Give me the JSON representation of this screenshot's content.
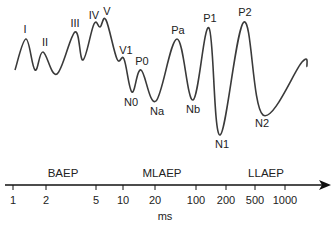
{
  "colors": {
    "waveform": "#3a3a3a",
    "axis": "#111111",
    "text": "#222222"
  },
  "waveform": {
    "points": [
      [
        15,
        70
      ],
      [
        26,
        39
      ],
      [
        35,
        70
      ],
      [
        43,
        52
      ],
      [
        57,
        74
      ],
      [
        75,
        32
      ],
      [
        83,
        60
      ],
      [
        94,
        24
      ],
      [
        100,
        27
      ],
      [
        106,
        20
      ],
      [
        117,
        59
      ],
      [
        124,
        59
      ],
      [
        132,
        92
      ],
      [
        141,
        70
      ],
      [
        156,
        101
      ],
      [
        177,
        39
      ],
      [
        193,
        100
      ],
      [
        209,
        28
      ],
      [
        220,
        135
      ],
      [
        244,
        22
      ],
      [
        263,
        115
      ],
      [
        302,
        62
      ],
      [
        307,
        67
      ]
    ]
  },
  "peaks": [
    {
      "label": "I",
      "x": 25,
      "y": 33
    },
    {
      "label": "II",
      "x": 45,
      "y": 46
    },
    {
      "label": "III",
      "x": 75,
      "y": 27
    },
    {
      "label": "IV",
      "x": 94,
      "y": 19
    },
    {
      "label": "V",
      "x": 107,
      "y": 15
    },
    {
      "label": "V1",
      "x": 126,
      "y": 54
    },
    {
      "label": "P0",
      "x": 142,
      "y": 65
    },
    {
      "label": "N0",
      "x": 131,
      "y": 106
    },
    {
      "label": "Na",
      "x": 157,
      "y": 115
    },
    {
      "label": "Pa",
      "x": 178,
      "y": 34
    },
    {
      "label": "Nb",
      "x": 193,
      "y": 113
    },
    {
      "label": "P1",
      "x": 210,
      "y": 22
    },
    {
      "label": "N1",
      "x": 222,
      "y": 148
    },
    {
      "label": "P2",
      "x": 245,
      "y": 16
    },
    {
      "label": "N2",
      "x": 262,
      "y": 127
    }
  ],
  "ranges": [
    {
      "label": "BAEP",
      "x": 63
    },
    {
      "label": "MLAEP",
      "x": 162
    },
    {
      "label": "LLAEP",
      "x": 266
    }
  ],
  "axis": {
    "unit": "ms",
    "ticks": [
      {
        "label": "1",
        "x": 13
      },
      {
        "label": "2",
        "x": 46
      },
      {
        "label": "5",
        "x": 96
      },
      {
        "label": "10",
        "x": 123
      },
      {
        "label": "20",
        "x": 155
      },
      {
        "label": "100",
        "x": 196
      },
      {
        "label": "200",
        "x": 226
      },
      {
        "label": "500",
        "x": 255
      },
      {
        "label": "1000",
        "x": 285
      }
    ]
  }
}
